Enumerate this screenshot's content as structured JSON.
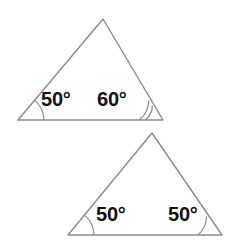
{
  "figure": {
    "background_color": "#ffffff",
    "stroke_color": "#8a8a8a",
    "label_color": "#121212",
    "stroke_width": 1.4,
    "degree_symbol": "°",
    "triangles": [
      {
        "id": "triangle-1",
        "name": "upper-left-triangle",
        "vertices": {
          "apex": [
            103,
            19
          ],
          "bottom_left": [
            18,
            120
          ],
          "bottom_right": [
            163,
            120
          ]
        },
        "angles": [
          {
            "position": "bottom-left",
            "label": "50°",
            "value": 50,
            "arc_count": 1,
            "arc_radius": 26
          },
          {
            "position": "bottom-right",
            "label": "60°",
            "value": 60,
            "arc_count": 2,
            "arc_radius": 24
          }
        ]
      },
      {
        "id": "triangle-2",
        "name": "lower-right-triangle",
        "clipped_edge": "right",
        "vertices": {
          "apex": [
            152,
            133
          ],
          "bottom_left": [
            68,
            235
          ],
          "bottom_right": [
            222,
            235
          ]
        },
        "angles": [
          {
            "position": "bottom-left",
            "label": "50°",
            "value": 50,
            "arc_count": 1,
            "arc_radius": 26
          },
          {
            "position": "bottom-right",
            "label": "50°",
            "value": 50,
            "arc_count": 1,
            "arc_radius": 24
          }
        ]
      }
    ]
  }
}
